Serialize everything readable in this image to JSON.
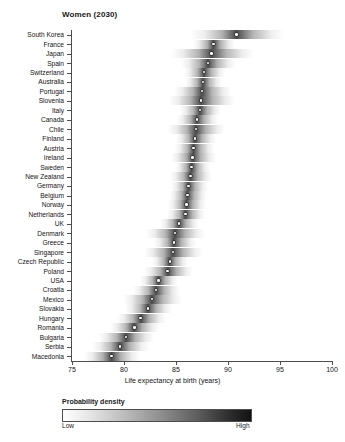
{
  "chart_data": {
    "type": "heatmap",
    "title": "Women (2030)",
    "xlabel": "Life expectancy at birth (years)",
    "ylabel": "",
    "xlim": [
      75,
      100
    ],
    "xticks": [
      75,
      80,
      85,
      90,
      95,
      100
    ],
    "grid": false,
    "legend": {
      "title": "Probability density",
      "low_label": "Low",
      "high_label": "High",
      "position": "bottom",
      "colors": {
        "low": "#ffffff",
        "high": "#121212"
      }
    },
    "categories": [
      "South Korea",
      "France",
      "Japan",
      "Spain",
      "Switzerland",
      "Australia",
      "Portugal",
      "Slovenia",
      "Italy",
      "Canada",
      "Chile",
      "Finland",
      "Austria",
      "Ireland",
      "Sweden",
      "New Zealand",
      "Germany",
      "Belgium",
      "Norway",
      "Netherlands",
      "UK",
      "Denmark",
      "Greece",
      "Singapore",
      "Czech Republic",
      "Poland",
      "USA",
      "Croatia",
      "Mexico",
      "Slovakia",
      "Hungary",
      "Romania",
      "Bulgaria",
      "Serbia",
      "Macedonia"
    ],
    "series": [
      {
        "name": "Median life expectancy (years)",
        "values": [
          90.8,
          88.6,
          88.4,
          88.1,
          87.7,
          87.6,
          87.5,
          87.4,
          87.3,
          87.0,
          86.9,
          86.8,
          86.7,
          86.6,
          86.5,
          86.4,
          86.2,
          86.1,
          86.0,
          85.9,
          85.3,
          84.9,
          84.8,
          84.7,
          84.4,
          84.2,
          83.3,
          83.1,
          82.7,
          82.3,
          81.6,
          81.0,
          80.2,
          79.6,
          78.8
        ]
      },
      {
        "name": "Lower bound of density band (years)",
        "values": [
          86.4,
          86.6,
          84.5,
          85.5,
          85.8,
          85.9,
          84.8,
          84.3,
          85.4,
          85.1,
          84.2,
          85.0,
          84.9,
          84.5,
          84.9,
          84.4,
          84.5,
          84.3,
          84.2,
          84.1,
          83.5,
          82.1,
          82.9,
          81.9,
          82.7,
          81.9,
          81.5,
          80.9,
          79.9,
          80.1,
          79.3,
          78.7,
          77.5,
          76.9,
          76.2
        ]
      },
      {
        "name": "Upper bound of density band (years)",
        "values": [
          95.4,
          90.7,
          92.5,
          90.8,
          89.7,
          89.4,
          90.3,
          90.7,
          89.3,
          89.0,
          89.7,
          88.8,
          88.7,
          88.8,
          88.3,
          88.5,
          88.1,
          88.0,
          87.9,
          87.8,
          87.2,
          87.8,
          86.9,
          87.6,
          86.2,
          86.6,
          85.2,
          85.4,
          85.6,
          84.6,
          84.0,
          83.4,
          82.9,
          82.4,
          81.5
        ]
      }
    ]
  }
}
